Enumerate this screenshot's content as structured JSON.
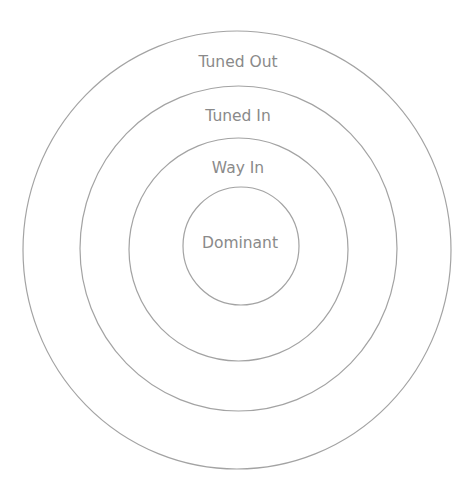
{
  "diagram": {
    "title": "",
    "type": "concentric-circles",
    "colors": {
      "stroke": "#a3a3a3",
      "text": "#8a8a8a",
      "background": "#ffffff"
    },
    "rings": [
      {
        "id": "tuned-out",
        "label": "Tuned Out",
        "cx": 237,
        "cy": 250,
        "rx": 214,
        "ry": 219,
        "label_x": 238,
        "label_y": 53
      },
      {
        "id": "tuned-in",
        "label": "Tuned In",
        "cx": 238.5,
        "cy": 248.5,
        "rx": 158.5,
        "ry": 162.5,
        "label_x": 238,
        "label_y": 107
      },
      {
        "id": "way-in",
        "label": "Way In",
        "cx": 238.5,
        "cy": 249.5,
        "rx": 109.5,
        "ry": 111.5,
        "label_x": 238,
        "label_y": 159
      },
      {
        "id": "dominant",
        "label": "Dominant",
        "cx": 241,
        "cy": 246,
        "rx": 58,
        "ry": 59,
        "label_x": 240,
        "label_y": 234
      }
    ]
  }
}
